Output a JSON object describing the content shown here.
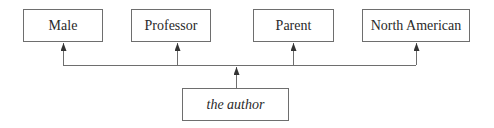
{
  "diagram": {
    "top_nodes": [
      {
        "label": "Male"
      },
      {
        "label": "Professor"
      },
      {
        "label": "Parent"
      },
      {
        "label": "North American"
      }
    ],
    "source_node": {
      "label": "the author"
    },
    "colors": {
      "line": "#6e6e6e",
      "text": "#2a2a2a",
      "background": "#ffffff"
    }
  }
}
